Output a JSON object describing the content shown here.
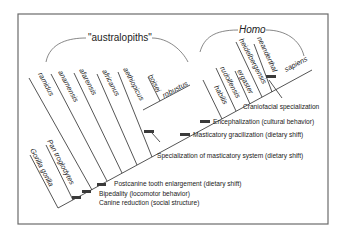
{
  "figure": {
    "groups": {
      "australopiths": "\"australopiths\"",
      "homo": "Homo"
    },
    "taxa": {
      "gorilla": "Gorilla gorilla",
      "pan": "Pan troglodytes",
      "ramidus": "ramidus",
      "anamensis": "anamensis",
      "afarensis": "afarensis",
      "africanus": "africanus",
      "aethiopicus": "aethiopicus",
      "boisei": "boisei",
      "robustus": "robustus",
      "habilis": "habilis",
      "rudolfensis": "rudolfensis",
      "ergaster": "ergaster",
      "heidelbergensis": "heidelbergensis",
      "neanderthal": "neanderthal",
      "sapiens": "sapiens"
    },
    "annotations": {
      "canine": "Canine reduction (social structure)",
      "bipedality": "Bipedality (locomotor behavior)",
      "postcanine": "Postcanine tooth enlargement (dietary shift)",
      "masticatory_spec": "Specialization of masticatory system (dietary shift)",
      "masticatory_grac": "Masticatory gracilization (dietary shift)",
      "encephalization": "Encephalization (cultural behavior)",
      "craniofacial": "Craniofacial specialization"
    }
  }
}
